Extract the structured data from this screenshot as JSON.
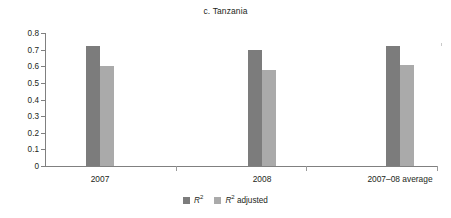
{
  "chart_data": {
    "type": "bar",
    "title": "c. Tanzania",
    "xlabel": "",
    "ylabel": "",
    "categories": [
      "2007",
      "2008",
      "2007–08 average"
    ],
    "series": [
      {
        "name": "R²",
        "name_base": "R",
        "name_sup": "2",
        "color": "#7c7c7c",
        "values": [
          0.72,
          0.7,
          0.72
        ]
      },
      {
        "name": "R² adjusted",
        "name_base": "R",
        "name_sup": "2",
        "name_suffix": " adjusted",
        "color": "#aaaaaa",
        "values": [
          0.6,
          0.575,
          0.605
        ]
      }
    ],
    "ylim": [
      0,
      0.8
    ],
    "yticks": [
      0,
      0.1,
      0.2,
      0.3,
      0.4,
      0.5,
      0.6,
      0.7,
      0.8
    ],
    "ytick_labels": [
      "0",
      "0.1",
      "0.2",
      "0.3",
      "0.4",
      "0.5",
      "0.6",
      "0.7",
      "0.8"
    ],
    "grid": false,
    "legend_position": "bottom"
  },
  "colors": {
    "series_r2": "#7c7c7c",
    "series_r2_adjusted": "#aaaaaa",
    "axis": "#808080",
    "text": "#231f20",
    "background": "#ffffff"
  }
}
